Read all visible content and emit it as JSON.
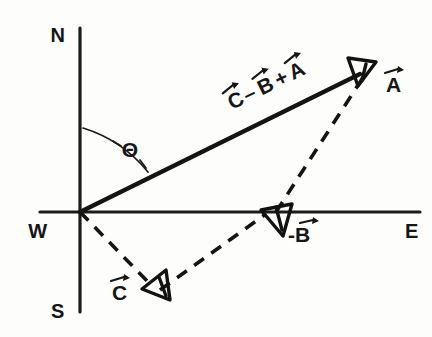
{
  "figure": {
    "background_color": "#fdfdfc",
    "ink_color": "#141414"
  },
  "axes": {
    "vertical_label_top": "N",
    "vertical_label_bottom": "S",
    "horizontal_label_left": "W",
    "horizontal_label_right": "E",
    "origin": {
      "x": 80,
      "y": 212
    },
    "vertical_top_y": 28,
    "vertical_bottom_y": 312,
    "horizontal_left_x": 40,
    "horizontal_right_x": 420
  },
  "angle": {
    "symbol": "Θ",
    "description": "angle from N axis to resultant vector",
    "label_x": 130,
    "label_y": 155
  },
  "vectors": [
    {
      "name": "resultant",
      "label": "C - B + A",
      "label_parts": [
        "C",
        "–",
        "B",
        "+",
        "A"
      ],
      "style": "solid",
      "from": {
        "x": 80,
        "y": 212
      },
      "to": {
        "x": 368,
        "y": 70
      },
      "label_x": 255,
      "label_y": 98,
      "label_rotation": -26
    },
    {
      "name": "A",
      "label": "A",
      "style": "dashed",
      "from": {
        "x": 272,
        "y": 214
      },
      "to": {
        "x": 366,
        "y": 74
      },
      "label_x": 388,
      "label_y": 83
    },
    {
      "name": "minus-B",
      "label": "-B",
      "style": "dashed",
      "from": {
        "x": 158,
        "y": 288
      },
      "to": {
        "x": 268,
        "y": 214
      },
      "label_x": 288,
      "label_y": 237
    },
    {
      "name": "C",
      "label": "C",
      "style": "dashed",
      "from": {
        "x": 80,
        "y": 212
      },
      "to": {
        "x": 152,
        "y": 286
      },
      "label_x": 116,
      "label_y": 296
    }
  ],
  "arrowheads": [
    {
      "name": "arrowhead-resultant",
      "tip_x": 368,
      "tip_y": 70
    },
    {
      "name": "arrowhead-minus-b",
      "tip_x": 263,
      "tip_y": 212
    },
    {
      "name": "arrowhead-c",
      "tip_x": 168,
      "tip_y": 299
    }
  ]
}
